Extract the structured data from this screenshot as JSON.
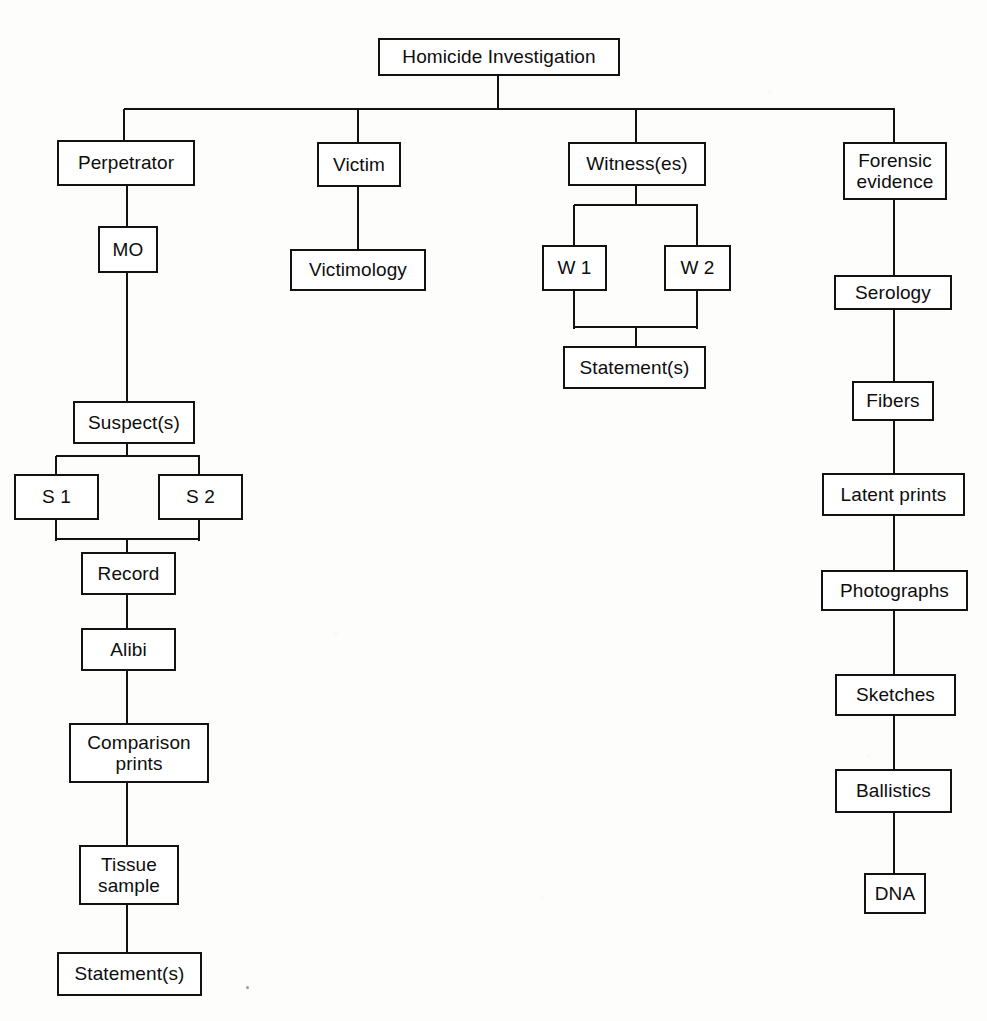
{
  "diagram": {
    "type": "tree",
    "ink_color": "#121212",
    "paper_color": "#fdfdfb"
  },
  "nodes": {
    "root": {
      "label": "Homicide Investigation",
      "x": 378,
      "y": 38,
      "w": 242,
      "h": 38
    },
    "perpetrator": {
      "label": "Perpetrator",
      "x": 57,
      "y": 140,
      "w": 138,
      "h": 46
    },
    "mo": {
      "label": "MO",
      "x": 98,
      "y": 226,
      "w": 60,
      "h": 47
    },
    "suspects": {
      "label": "Suspect(s)",
      "x": 73,
      "y": 401,
      "w": 122,
      "h": 43
    },
    "s1": {
      "label": "S 1",
      "x": 14,
      "y": 474,
      "w": 85,
      "h": 46
    },
    "s2": {
      "label": "S 2",
      "x": 158,
      "y": 474,
      "w": 85,
      "h": 46
    },
    "record": {
      "label": "Record",
      "x": 81,
      "y": 552,
      "w": 95,
      "h": 43
    },
    "alibi": {
      "label": "Alibi",
      "x": 81,
      "y": 628,
      "w": 95,
      "h": 43
    },
    "comparison_prints": {
      "label": "Comparison\nprints",
      "x": 69,
      "y": 723,
      "w": 140,
      "h": 60
    },
    "tissue_sample": {
      "label": "Tissue\nsample",
      "x": 79,
      "y": 845,
      "w": 100,
      "h": 60
    },
    "statement_left": {
      "label": "Statement(s)",
      "x": 57,
      "y": 952,
      "w": 145,
      "h": 44
    },
    "victim": {
      "label": "Victim",
      "x": 317,
      "y": 142,
      "w": 84,
      "h": 45
    },
    "victimology": {
      "label": "Victimology",
      "x": 290,
      "y": 249,
      "w": 136,
      "h": 42
    },
    "witnesses": {
      "label": "Witness(es)",
      "x": 568,
      "y": 142,
      "w": 138,
      "h": 44
    },
    "w1": {
      "label": "W 1",
      "x": 542,
      "y": 245,
      "w": 65,
      "h": 46
    },
    "w2": {
      "label": "W 2",
      "x": 664,
      "y": 245,
      "w": 67,
      "h": 46
    },
    "statement_witness": {
      "label": "Statement(s)",
      "x": 563,
      "y": 346,
      "w": 143,
      "h": 43
    },
    "forensic_evidence": {
      "label": "Forensic\nevidence",
      "x": 843,
      "y": 142,
      "w": 104,
      "h": 58
    },
    "serology": {
      "label": "Serology",
      "x": 834,
      "y": 275,
      "w": 118,
      "h": 35
    },
    "fibers": {
      "label": "Fibers",
      "x": 852,
      "y": 381,
      "w": 82,
      "h": 40
    },
    "latent_prints": {
      "label": "Latent prints",
      "x": 822,
      "y": 473,
      "w": 143,
      "h": 43
    },
    "photographs": {
      "label": "Photographs",
      "x": 821,
      "y": 570,
      "w": 147,
      "h": 41
    },
    "sketches": {
      "label": "Sketches",
      "x": 835,
      "y": 674,
      "w": 121,
      "h": 42
    },
    "ballistics": {
      "label": "Ballistics",
      "x": 835,
      "y": 769,
      "w": 117,
      "h": 44
    },
    "dna": {
      "label": "DNA",
      "x": 864,
      "y": 873,
      "w": 62,
      "h": 41
    }
  },
  "edges": [
    {
      "name": "root-to-distribution-bar",
      "orient": "v",
      "x": 498,
      "y": 76,
      "len": 33
    },
    {
      "name": "level1-distribution-bar",
      "orient": "h",
      "x": 124,
      "y": 109,
      "len": 771
    },
    {
      "name": "bar-to-perpetrator",
      "orient": "v",
      "x": 124,
      "y": 109,
      "len": 33
    },
    {
      "name": "bar-to-victim",
      "orient": "v",
      "x": 358,
      "y": 109,
      "len": 35
    },
    {
      "name": "bar-to-witnesses",
      "orient": "v",
      "x": 636,
      "y": 109,
      "len": 35
    },
    {
      "name": "bar-to-forensic-evidence",
      "orient": "v",
      "x": 894,
      "y": 109,
      "len": 35
    },
    {
      "name": "perpetrator-to-mo",
      "orient": "v",
      "x": 127,
      "y": 186,
      "len": 41
    },
    {
      "name": "mo-to-suspects",
      "orient": "v",
      "x": 127,
      "y": 272,
      "len": 130
    },
    {
      "name": "suspects-to-split",
      "orient": "v",
      "x": 127,
      "y": 444,
      "len": 13
    },
    {
      "name": "suspect-split-bar",
      "orient": "h",
      "x": 56,
      "y": 456,
      "len": 144
    },
    {
      "name": "split-to-s1",
      "orient": "v",
      "x": 56,
      "y": 456,
      "len": 19
    },
    {
      "name": "split-to-s2",
      "orient": "v",
      "x": 199,
      "y": 456,
      "len": 19
    },
    {
      "name": "s1-to-merge",
      "orient": "v",
      "x": 56,
      "y": 519,
      "len": 22
    },
    {
      "name": "s2-to-merge",
      "orient": "v",
      "x": 199,
      "y": 519,
      "len": 22
    },
    {
      "name": "suspect-merge-bar",
      "orient": "h",
      "x": 56,
      "y": 539,
      "len": 144
    },
    {
      "name": "merge-to-record",
      "orient": "v",
      "x": 127,
      "y": 539,
      "len": 14
    },
    {
      "name": "record-to-alibi",
      "orient": "v",
      "x": 127,
      "y": 594,
      "len": 35
    },
    {
      "name": "alibi-to-comparison-prints",
      "orient": "v",
      "x": 127,
      "y": 670,
      "len": 54
    },
    {
      "name": "comparison-to-tissue",
      "orient": "v",
      "x": 127,
      "y": 782,
      "len": 64
    },
    {
      "name": "tissue-to-statement",
      "orient": "v",
      "x": 127,
      "y": 904,
      "len": 49
    },
    {
      "name": "victim-to-victimology",
      "orient": "v",
      "x": 358,
      "y": 186,
      "len": 64
    },
    {
      "name": "witnesses-to-split",
      "orient": "v",
      "x": 636,
      "y": 186,
      "len": 20
    },
    {
      "name": "witness-split-bar",
      "orient": "h",
      "x": 574,
      "y": 205,
      "len": 124
    },
    {
      "name": "split-to-w1",
      "orient": "v",
      "x": 574,
      "y": 205,
      "len": 41
    },
    {
      "name": "split-to-w2",
      "orient": "v",
      "x": 697,
      "y": 205,
      "len": 41
    },
    {
      "name": "w1-to-merge",
      "orient": "v",
      "x": 574,
      "y": 290,
      "len": 39
    },
    {
      "name": "w2-to-merge",
      "orient": "v",
      "x": 697,
      "y": 290,
      "len": 39
    },
    {
      "name": "witness-merge-bar",
      "orient": "h",
      "x": 574,
      "y": 327,
      "len": 124
    },
    {
      "name": "merge-to-statement",
      "orient": "v",
      "x": 636,
      "y": 327,
      "len": 20
    },
    {
      "name": "forensic-to-serology",
      "orient": "v",
      "x": 894,
      "y": 200,
      "len": 76
    },
    {
      "name": "serology-to-fibers",
      "orient": "v",
      "x": 894,
      "y": 309,
      "len": 73
    },
    {
      "name": "fibers-to-latent-prints",
      "orient": "v",
      "x": 894,
      "y": 420,
      "len": 54
    },
    {
      "name": "latent-to-photographs",
      "orient": "v",
      "x": 894,
      "y": 515,
      "len": 56
    },
    {
      "name": "photographs-to-sketches",
      "orient": "v",
      "x": 894,
      "y": 610,
      "len": 65
    },
    {
      "name": "sketches-to-ballistics",
      "orient": "v",
      "x": 894,
      "y": 715,
      "len": 55
    },
    {
      "name": "ballistics-to-dna",
      "orient": "v",
      "x": 894,
      "y": 812,
      "len": 62
    }
  ],
  "specks": [
    {
      "name": "scan-speck",
      "x": 246,
      "y": 986
    }
  ]
}
